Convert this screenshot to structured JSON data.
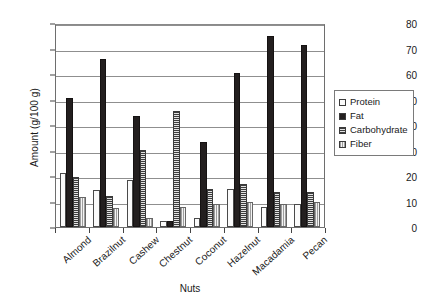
{
  "chart_data": {
    "type": "bar",
    "title": "",
    "xlabel": "Nuts",
    "ylabel": "Amount (g/100 g)",
    "ylim": [
      0,
      80
    ],
    "yticks": [
      0,
      10,
      20,
      30,
      40,
      50,
      60,
      70,
      80
    ],
    "grid": true,
    "legend_position": "right",
    "categories": [
      "Almond",
      "Brazilnut",
      "Cashew",
      "Chestnut",
      "Coconut",
      "Hazelnut",
      "Macadamia",
      "Pecan"
    ],
    "series": [
      {
        "name": "Protein",
        "pattern": "light-dotted",
        "values": [
          21.5,
          14.5,
          18.5,
          2.5,
          3.5,
          15.0,
          8.0,
          9.0
        ]
      },
      {
        "name": "Fat",
        "pattern": "solid-black",
        "values": [
          51.0,
          66.5,
          44.0,
          2.3,
          33.5,
          61.0,
          75.5,
          72.0
        ]
      },
      {
        "name": "Carbohydrate",
        "pattern": "horizontal-lines",
        "values": [
          20.0,
          12.3,
          30.5,
          46.0,
          15.0,
          17.0,
          14.0,
          14.0
        ]
      },
      {
        "name": "Fiber",
        "pattern": "vertical-lines",
        "values": [
          12.0,
          7.5,
          3.5,
          8.0,
          9.0,
          10.0,
          9.0,
          10.0
        ]
      }
    ]
  },
  "legend": {
    "items": [
      {
        "label": "Protein"
      },
      {
        "label": "Fat"
      },
      {
        "label": "Carbohydrate"
      },
      {
        "label": "Fiber"
      }
    ]
  }
}
